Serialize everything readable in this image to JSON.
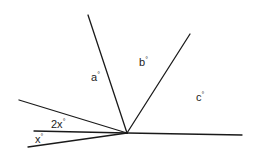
{
  "diagram": {
    "type": "angles-around-point",
    "vertex": {
      "x": 127,
      "y": 133
    },
    "rays": [
      {
        "name": "ray-a-top",
        "x": 88,
        "y": 15
      },
      {
        "name": "ray-b-top",
        "x": 190,
        "y": 34
      },
      {
        "name": "ray-right",
        "x": 242,
        "y": 135
      },
      {
        "name": "ray-upper-left",
        "x": 19,
        "y": 100
      },
      {
        "name": "ray-middle-left",
        "x": 34,
        "y": 131
      },
      {
        "name": "ray-lower-left",
        "x": 28,
        "y": 147
      }
    ],
    "labels": {
      "a": {
        "text": "a",
        "deg": "°"
      },
      "b": {
        "text": "b",
        "deg": "°"
      },
      "c": {
        "text": "c",
        "deg": "°"
      },
      "two_x": {
        "text": "2x",
        "deg": "°"
      },
      "x": {
        "text": "x",
        "deg": "°"
      }
    },
    "colors": {
      "line": "#1a1a1a",
      "text": "#222222",
      "background": "#ffffff"
    }
  }
}
